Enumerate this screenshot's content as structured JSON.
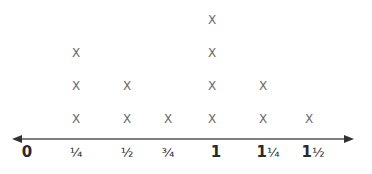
{
  "chart_data": {
    "type": "line_plot",
    "title": "",
    "xlabel": "",
    "ylabel": "",
    "mark_symbol": "X",
    "categories": [
      "0",
      "1/4",
      "1/2",
      "3/4",
      "1",
      "1 1/4",
      "1 1/2"
    ],
    "tick_labels": [
      {
        "whole": "0",
        "frac": ""
      },
      {
        "whole": "",
        "frac": "¼"
      },
      {
        "whole": "",
        "frac": "½"
      },
      {
        "whole": "",
        "frac": "¾"
      },
      {
        "whole": "1",
        "frac": ""
      },
      {
        "whole": "1",
        "frac": "¼"
      },
      {
        "whole": "1",
        "frac": "½"
      }
    ],
    "values": [
      0,
      3,
      2,
      1,
      4,
      2,
      1
    ],
    "xlim": [
      0,
      1.5
    ],
    "grid": false,
    "legend": null,
    "axis": {
      "arrows": "both",
      "color": "#555555"
    },
    "mark_color": "#6a6a6a"
  }
}
